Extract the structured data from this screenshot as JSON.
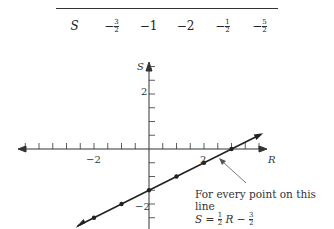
{
  "table": {
    "row_label": "S",
    "values": [
      "−3/2",
      "−1",
      "−2",
      "−1/2",
      "−5/2"
    ],
    "display": [
      {
        "sign": "−",
        "num": "3",
        "den": "2"
      },
      {
        "sign": "−",
        "whole": "1"
      },
      {
        "sign": "−",
        "whole": "2"
      },
      {
        "sign": "−",
        "num": "1",
        "den": "2"
      },
      {
        "sign": "−",
        "num": "5",
        "den": "2"
      }
    ]
  },
  "chart_data": {
    "type": "line",
    "title": "",
    "xlabel": "R",
    "ylabel": "S",
    "x_tick_labels": [
      "−2",
      "2"
    ],
    "y_tick_labels": [
      "2",
      "−2"
    ],
    "xlim": [
      -5,
      4
    ],
    "ylim": [
      -3,
      3.5
    ],
    "tick_interval": 0.5,
    "series": [
      {
        "name": "S = 1/2 R − 3/2",
        "x": [
          -2,
          -1,
          0,
          1,
          2,
          3
        ],
        "y": [
          -2.5,
          -2,
          -1.5,
          -1,
          -0.5,
          0
        ]
      }
    ],
    "annotations": [
      {
        "text": "For every point on this line",
        "formula": "S = 1/2 R − 3/2"
      }
    ]
  },
  "annotation": {
    "line1": "For every point on this line",
    "formula_lhs": "S = ",
    "formula_mid": "R − ",
    "f1_num": "1",
    "f1_den": "2",
    "f2_num": "3",
    "f2_den": "2"
  },
  "axis": {
    "x_label": "R",
    "y_label": "S",
    "x_tick_neg": "−2",
    "x_tick_pos": "2",
    "y_tick_pos": "2",
    "y_tick_neg": "−2"
  }
}
